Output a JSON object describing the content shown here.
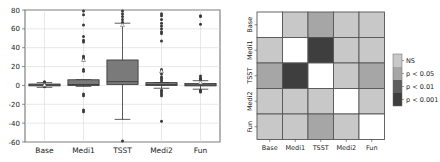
{
  "chart_data": [
    {
      "type": "box",
      "title": "",
      "xlabel": "",
      "ylabel": "",
      "ylim": [
        -60,
        80
      ],
      "yticks": [
        80,
        60,
        40,
        20,
        0,
        -20,
        -40,
        -60
      ],
      "grid": true,
      "categories": [
        "Base",
        "Medi1",
        "TSST",
        "Medi2",
        "Fun"
      ],
      "box_color": "#7a7a7a",
      "series": [
        {
          "name": "Base",
          "q1": -0.5,
          "median": 0.5,
          "q3": 1.5,
          "whisker_low": -2,
          "whisker_high": 3,
          "mean": 0.5,
          "outliers": [
            4,
            3.5,
            -1.5
          ]
        },
        {
          "name": "Medi1",
          "q1": 0,
          "median": 1,
          "q3": 6,
          "whisker_low": -1,
          "whisker_high": 6,
          "mean": 27,
          "outliers": [
            79,
            75,
            64,
            52,
            48,
            46,
            31,
            29,
            27,
            17,
            15,
            -9,
            -11,
            -26,
            -28
          ]
        },
        {
          "name": "TSST",
          "q1": 1,
          "median": 4,
          "q3": 27,
          "whisker_low": -36,
          "whisker_high": 66,
          "mean": 64,
          "outliers": [
            79,
            76,
            73,
            70,
            67,
            -59
          ]
        },
        {
          "name": "Medi2",
          "q1": 0,
          "median": 1,
          "q3": 3,
          "whisker_low": -3,
          "whisker_high": 3,
          "mean": 15,
          "outliers": [
            76,
            74,
            70,
            66,
            63,
            60,
            57,
            55,
            47,
            17,
            15,
            12,
            9,
            7,
            5,
            -5,
            -7,
            -9,
            -11,
            -38
          ]
        },
        {
          "name": "Fun",
          "q1": -0.5,
          "median": 0.5,
          "q3": 2,
          "whisker_low": -4,
          "whisker_high": 5,
          "mean": 3,
          "outliers": [
            74,
            73,
            65,
            10,
            8,
            7,
            6,
            -5,
            -6,
            -7
          ]
        }
      ]
    },
    {
      "type": "heatmap",
      "title": "",
      "x_labels": [
        "Base",
        "Medi1",
        "TSST",
        "Medi2",
        "Fun"
      ],
      "y_labels": [
        "Base",
        "Medi1",
        "TSST",
        "Medi2",
        "Fun"
      ],
      "matrix": [
        [
          "diag",
          "NS",
          "p < 0.05",
          "NS",
          "NS"
        ],
        [
          "NS",
          "diag",
          "p < 0.001",
          "NS",
          "NS"
        ],
        [
          "p < 0.05",
          "p < 0.001",
          "diag",
          "NS",
          "p < 0.05"
        ],
        [
          "NS",
          "NS",
          "NS",
          "diag",
          "NS"
        ],
        [
          "NS",
          "NS",
          "p < 0.05",
          "NS",
          "diag"
        ]
      ],
      "legend": [
        {
          "label": "NS",
          "color": "#c8c8c8"
        },
        {
          "label": "p < 0.05",
          "color": "#a6a6a6"
        },
        {
          "label": "p < 0.01",
          "color": "#5e5e5e"
        },
        {
          "label": "p < 0.001",
          "color": "#3e3e3e"
        }
      ],
      "diag_color": "#ffffff",
      "legend_position": "right"
    }
  ]
}
